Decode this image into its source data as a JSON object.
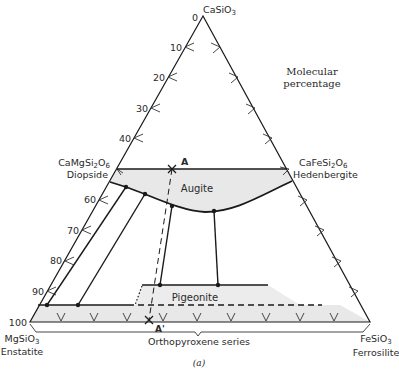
{
  "diagram": {
    "colors": {
      "line": "#1a1a1a",
      "fill": "#e8e8e8",
      "text": "#2a2a2a"
    },
    "vertices": {
      "top": {
        "formula": "CaSiO",
        "subscript": "3",
        "name": ""
      },
      "left": {
        "formula": "MgSiO",
        "subscript": "3",
        "name": "Enstatite"
      },
      "right": {
        "formula": "FeSiO",
        "subscript": "3",
        "name": "Ferrosilite"
      }
    },
    "mid_endmembers": {
      "diopside": {
        "formula_a": "CaMgSi",
        "sub1": "2",
        "formula_b": "O",
        "sub2": "6",
        "name": "Diopside"
      },
      "hedenbergite": {
        "formula_a": "CaFeSi",
        "sub1": "2",
        "formula_b": "O",
        "sub2": "6",
        "name": "Hedenbergite"
      }
    },
    "axis_ticks": [
      "0",
      "10",
      "20",
      "30",
      "40",
      "60",
      "70",
      "80",
      "90",
      "100"
    ],
    "note_line1": "Molecular",
    "note_line2": "percentage",
    "regions": {
      "augite": "Augite",
      "pigeonite": "Pigeonite"
    },
    "points": {
      "a": "A",
      "a_prime": "A'"
    },
    "bottom_label": "Orthopyroxene series",
    "caption": "(a)"
  }
}
